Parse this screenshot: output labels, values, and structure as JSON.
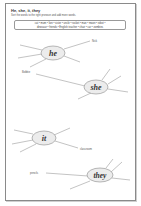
{
  "worksheet": {
    "title": "He, she, it, they",
    "instruction": "Sort the words to the right pronoun and add more words.",
    "word_bank_line1": "cat • mum • lion • sister • uncle • rocket • man • moon • robot •",
    "word_bank_line2": "dinosaur • friends • English teacher • chair • car • zombies",
    "webs": [
      {
        "pronoun": "he",
        "example": "Nick"
      },
      {
        "pronoun": "she",
        "example": "Bobbie"
      },
      {
        "pronoun": "it",
        "example": "classroom"
      },
      {
        "pronoun": "they",
        "example": "pencils"
      }
    ],
    "colors": {
      "ellipse_fill": "#ececec",
      "ellipse_stroke": "#8a8a8a",
      "line": "#9a9a9a",
      "border": "#8a8a8a"
    }
  }
}
